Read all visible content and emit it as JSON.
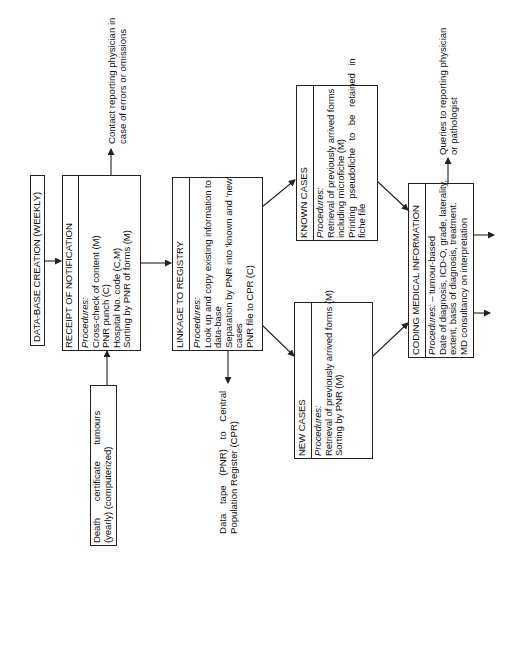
{
  "diagram": {
    "orientation": "rotated-90-ccw",
    "boxes": {
      "database_creation": {
        "title": "DATA-BASE CREATION (WEEKLY)"
      },
      "receipt": {
        "title": "RECEIPT OF NOTIFICATION",
        "procedures_label": "Procedures:",
        "items": [
          "Cross-check of content (M)",
          "PNR punch (C)",
          "Hospital No. code (C,M)",
          "Sorting by PNR of forms (M)"
        ]
      },
      "death_certificate": {
        "lines": [
          "Death certificate tumours",
          "(yearly) (computerized)"
        ]
      },
      "linkage": {
        "title": "LINKAGE TO REGISTRY",
        "procedures_label": "Procedures:",
        "items": [
          "Look up and copy existing information to",
          "data-base",
          "Separation by PNR into 'known and 'new'",
          "cases",
          "PNR file to CPR (C)"
        ]
      },
      "known_cases": {
        "title": "KNOWN CASES",
        "procedures_label": "Procedures:",
        "items": [
          "Retrieval of previously arrived forms",
          "including microfiche (M)",
          "Printing pseudofiche to be retained in",
          "fiche file"
        ]
      },
      "new_cases": {
        "title": "NEW CASES",
        "procedures_label": "Procedures:",
        "items": [
          "Retrieval of previously arrived forms (M)",
          "Sorting by PNR (M)"
        ]
      },
      "coding": {
        "title": "CODING MEDICAL INFORMATION",
        "procedures_label": "Procedures:",
        "procedures_suffix": " – tumour-based",
        "items": [
          "Date of diagnosis, ICD-O, grade, laterality,",
          "extent, basis of diagnosis, treatment.",
          "MD consultancy on interpretation"
        ]
      }
    },
    "annotations": {
      "contact_physician": [
        "Contact reporting physician in",
        "case of errors or omissions"
      ],
      "data_tape": [
        "Data tape (PNR) to Central",
        "Population Register (CPR)"
      ],
      "queries": [
        "Queries to reporting physician",
        "or pathologist"
      ]
    },
    "colors": {
      "line": "#222222",
      "background": "#ffffff"
    }
  }
}
